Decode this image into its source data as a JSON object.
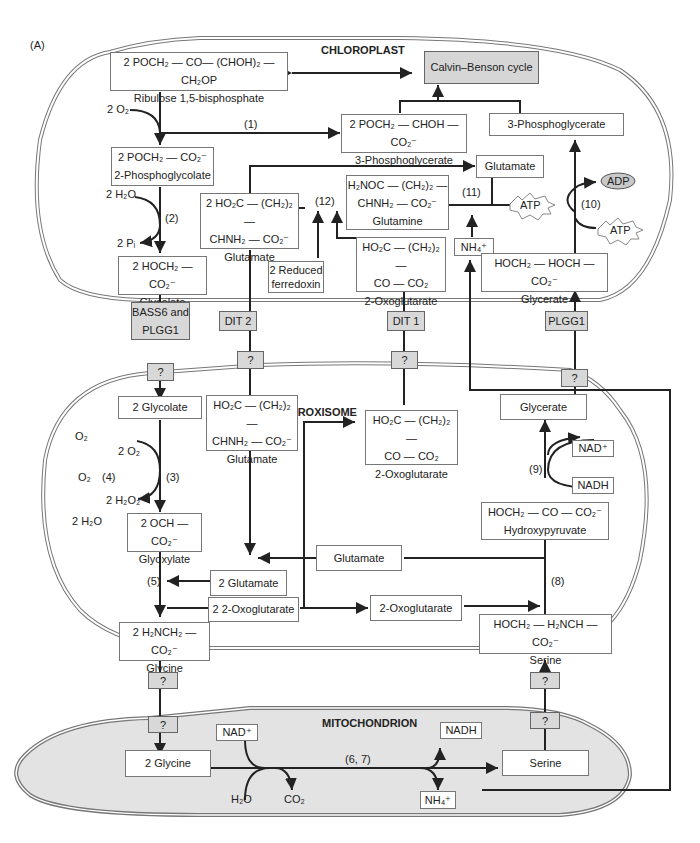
{
  "figure_label": "(A)",
  "compartments": {
    "chloroplast": "CHLOROPLAST",
    "peroxisome": "PEROXISOME",
    "mitochondrion": "MITOCHONDRION"
  },
  "chloroplast": {
    "rubp": {
      "formula": "2 POCH₂ — CO— (CHOH)₂ —CH₂OP",
      "name": "Ribulose 1,5-bisphosphate"
    },
    "calvin": "Calvin–Benson cycle",
    "pga2": {
      "formula": "2 POCH₂ — CHOH — CO₂⁻",
      "name": "3-Phosphoglycerate"
    },
    "pga": "3-Phosphoglycerate",
    "pglycolate": {
      "formula": "2 POCH₂ — CO₂⁻",
      "name": "2-Phosphoglycolate"
    },
    "glycolate": {
      "formula": "2 HOCH₂ — CO₂⁻",
      "name": "Glycolate"
    },
    "glutamate2": {
      "line1": "2 HO₂C — (CH₂)₂ —",
      "line2": "CHNH₂ — CO₂⁻",
      "name": "Glutamate"
    },
    "glutamine": {
      "line1": "H₂NOC — (CH₂)₂ —",
      "line2": "CHNH₂ — CO₂⁻",
      "name": "Glutamine"
    },
    "oxoglutarate": {
      "line1": "HO₂C — (CH₂)₂ —",
      "line2": "CO — CO₂",
      "name": "2-Oxoglutarate"
    },
    "ferredoxin": {
      "line1": "2 Reduced",
      "line2": "ferredoxin"
    },
    "glutamate": "Glutamate",
    "nh4": "NH₄⁺",
    "atp11": "ATP",
    "atp10": "ATP",
    "adp": "ADP",
    "glycerate": {
      "formula": "HOCH₂ — HOCH — CO₂⁻",
      "name": "Glycerate"
    },
    "o2": "2 O₂",
    "h2o": "2 H₂O",
    "pi": "2 Pᵢ",
    "steps": {
      "s1": "(1)",
      "s2": "(2)",
      "s10": "(10)",
      "s11": "(11)",
      "s12": "(12)"
    }
  },
  "transporters": {
    "bass6": {
      "line1": "BASS6 and",
      "line2": "PLGG1"
    },
    "dit2": "DIT 2",
    "dit1": "DIT 1",
    "plgg1": "PLGG1",
    "unknown": "?"
  },
  "peroxisome": {
    "glycolate": "2 Glycolate",
    "glutamate": {
      "line1": "HO₂C — (CH₂)₂ —",
      "line2": "CHNH₂ — CO₂⁻",
      "name": "Glutamate"
    },
    "oxoglutarate": {
      "line1": "HO₂C — (CH₂)₂ —",
      "line2": "CO — CO₂",
      "name": "2-Oxoglutarate"
    },
    "glycerate": "Glycerate",
    "nad": "NAD⁺",
    "nadh": "NADH",
    "hydroxypyruvate": {
      "formula": "HOCH₂ — CO — CO₂⁻",
      "name": "Hydroxypyruvate"
    },
    "glyoxylate": {
      "formula": "2 OCH — CO₂⁻",
      "name": "Glyoxylate"
    },
    "glutamate_mid": "Glutamate",
    "glutamate_2": "2 Glutamate",
    "oxoglutarate_2": "2 2-Oxoglutarate",
    "oxoglutarate_r": "2-Oxoglutarate",
    "glycine": {
      "formula": "2 H₂NCH₂ — CO₂⁻",
      "name": "Glycine"
    },
    "serine": {
      "formula": "HOCH₂ — H₂NCH — CO₂⁻",
      "name": "Serine"
    },
    "o2_a": "O₂",
    "o2_b": "O₂",
    "o2_2": "2 O₂",
    "h2o2": "2 H₂O₂",
    "h2o": "2 H₂O",
    "steps": {
      "s3": "(3)",
      "s4": "(4)",
      "s5": "(5)",
      "s8": "(8)",
      "s9": "(9)"
    }
  },
  "mitochondrion": {
    "glycine": "2 Glycine",
    "serine": "Serine",
    "nad": "NAD⁺",
    "nadh": "NADH",
    "h2o": "H₂O",
    "co2": "CO₂",
    "nh4": "NH₄⁺",
    "step": "(6, 7)"
  }
}
